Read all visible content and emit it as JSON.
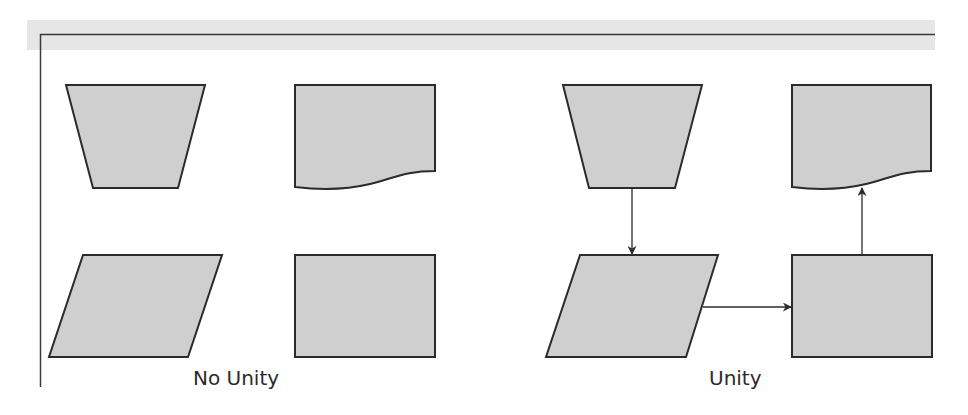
{
  "diagram": {
    "type": "flowchart-comparison",
    "colors": {
      "shape_fill": "#cfcfcf",
      "stroke": "#2b2b2b",
      "band": "#e6e6e6",
      "frame_line": "#3a3a3a"
    },
    "panels": [
      {
        "label": "No Unity",
        "shapes": [
          "manual-operation-trapezoid",
          "document",
          "data-parallelogram",
          "process-rectangle"
        ],
        "connections": []
      },
      {
        "label": "Unity",
        "shapes": [
          "manual-operation-trapezoid",
          "document",
          "data-parallelogram",
          "process-rectangle"
        ],
        "connections": [
          {
            "from": "manual-operation-trapezoid",
            "to": "data-parallelogram",
            "direction": "down"
          },
          {
            "from": "data-parallelogram",
            "to": "process-rectangle",
            "direction": "right"
          },
          {
            "from": "process-rectangle",
            "to": "document",
            "direction": "up"
          }
        ]
      }
    ]
  }
}
